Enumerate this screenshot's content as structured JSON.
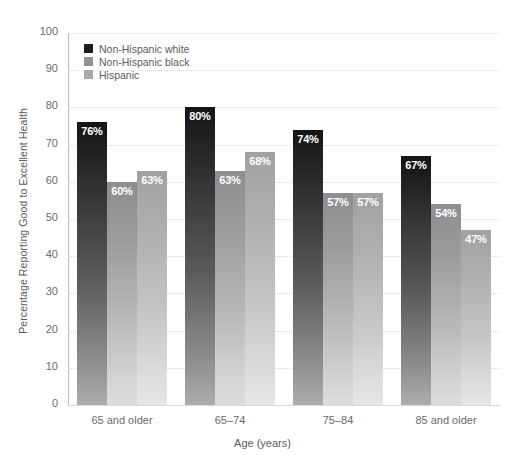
{
  "chart_data": {
    "type": "bar",
    "title": "",
    "xlabel": "Age (years)",
    "ylabel": "Percentage Reporting Good to Excellent Health",
    "categories": [
      "65 and older",
      "65–74",
      "75–84",
      "85 and older"
    ],
    "series": [
      {
        "name": "Non-Hispanic white",
        "values": [
          76,
          80,
          74,
          67
        ],
        "labels": [
          "76%",
          "80%",
          "74%",
          "67%"
        ],
        "color": "#1d1d1d"
      },
      {
        "name": "Non-Hispanic black",
        "values": [
          60,
          63,
          57,
          54
        ],
        "labels": [
          "60%",
          "63%",
          "57%",
          "54%"
        ],
        "color": "#919294"
      },
      {
        "name": "Hispanic",
        "values": [
          63,
          68,
          57,
          47
        ],
        "labels": [
          "63%",
          "68%",
          "57%",
          "47%"
        ],
        "color": "#a9aaac"
      }
    ],
    "ylim": [
      0,
      100
    ],
    "yticks": [
      "100",
      "90",
      "80",
      "70",
      "60",
      "50",
      "40",
      "30",
      "20",
      "10",
      "0"
    ],
    "grid": true,
    "legend_position": "top-left"
  },
  "axis": {
    "y_title": "Percentage Reporting Good to Excellent Health",
    "x_title": "Age (years)"
  }
}
